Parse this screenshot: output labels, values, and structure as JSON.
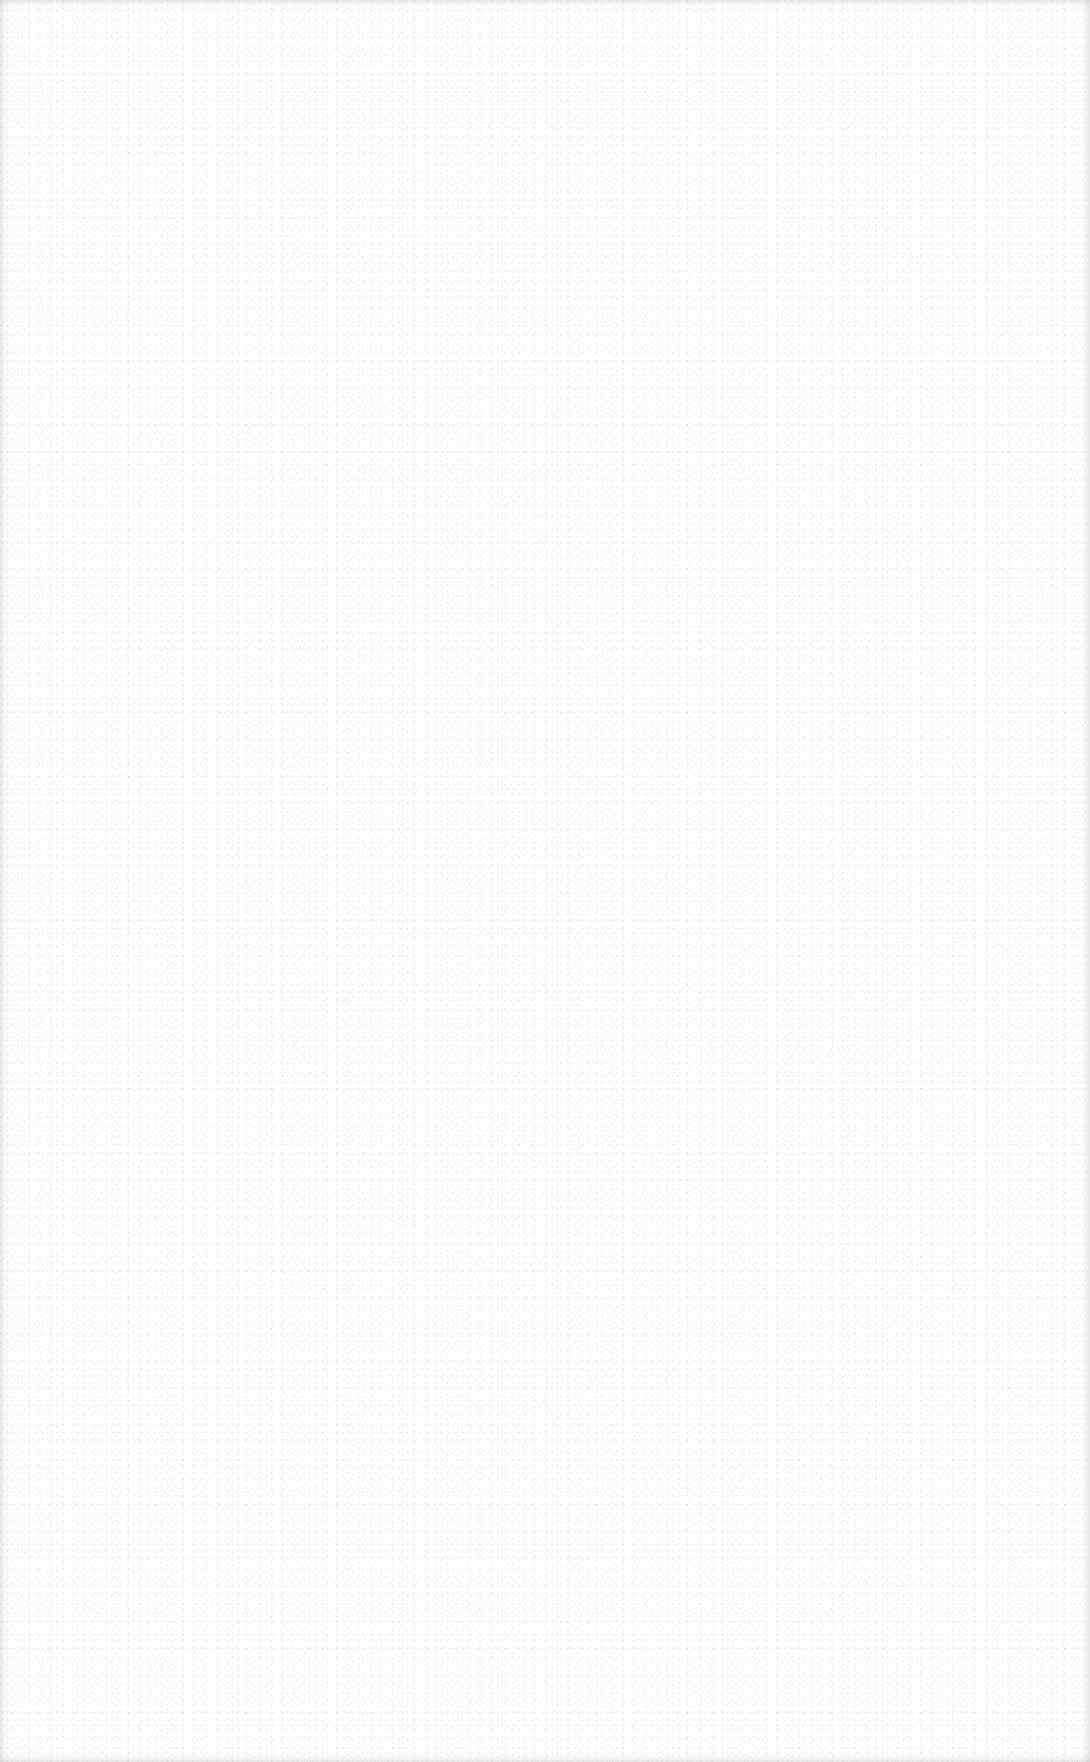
{
  "page": {
    "type": "blank-scanned-page",
    "background_color": "#fefefe",
    "text": ""
  }
}
